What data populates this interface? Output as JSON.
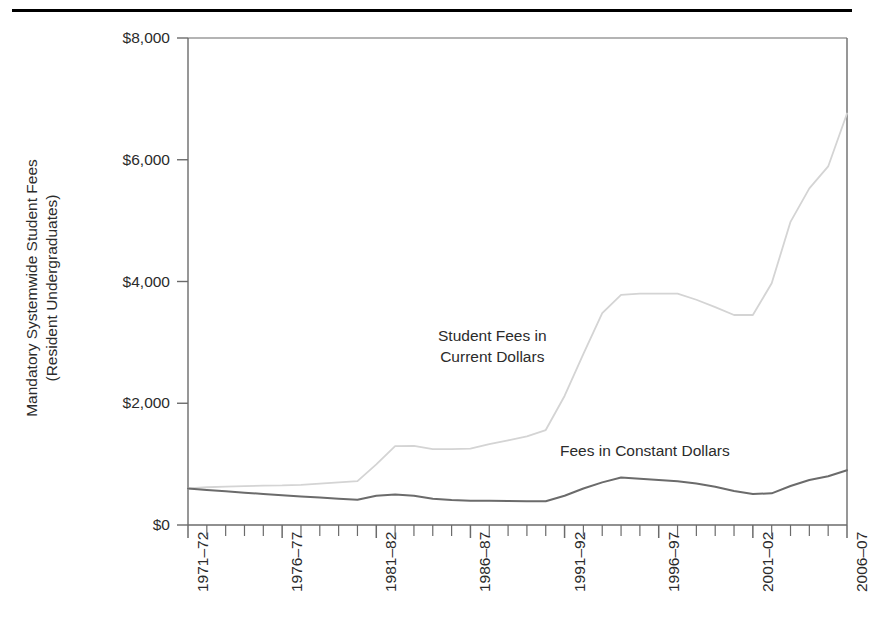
{
  "figure": {
    "background_color": "#ffffff",
    "top_rule_color": "#000000",
    "axis_color": "#6b6b6b",
    "text_color": "#2b2b2b"
  },
  "axes": {
    "y_axis_title": "Mandatory Systemwide Student Fees\n(Resident Undergraduates)",
    "y_ticks": [
      "$0",
      "$2,000",
      "$4,000",
      "$6,000",
      "$8,000"
    ],
    "x_ticks_labeled": [
      "1971–72",
      "1976–77",
      "1981–82",
      "1986–87",
      "1991–92",
      "1996–97",
      "2001–02",
      "2006–07"
    ]
  },
  "series_labels": {
    "current": "Student Fees in\nCurrent Dollars",
    "constant": "Fees in Constant Dollars"
  },
  "chart_data": {
    "type": "line",
    "title": "",
    "xlabel": "",
    "ylabel": "Mandatory Systemwide Student Fees (Resident Undergraduates)",
    "xlim": [
      "1971-72",
      "2006-07"
    ],
    "ylim": [
      0,
      8000
    ],
    "ytick_values": [
      0,
      2000,
      4000,
      6000,
      8000
    ],
    "grid": false,
    "legend": "inline-annotations",
    "x": [
      "1971-72",
      "1972-73",
      "1973-74",
      "1974-75",
      "1975-76",
      "1976-77",
      "1977-78",
      "1978-79",
      "1979-80",
      "1980-81",
      "1981-82",
      "1982-83",
      "1983-84",
      "1984-85",
      "1985-86",
      "1986-87",
      "1987-88",
      "1988-89",
      "1989-90",
      "1990-91",
      "1991-92",
      "1992-93",
      "1993-94",
      "1994-95",
      "1995-96",
      "1996-97",
      "1997-98",
      "1998-99",
      "1999-00",
      "2000-01",
      "2001-02",
      "2002-03",
      "2003-04",
      "2004-05",
      "2005-06",
      "2006-07"
    ],
    "series": [
      {
        "name": "Student Fees in Current Dollars",
        "color": "#d4d4d4",
        "values": [
          600,
          620,
          630,
          640,
          647,
          650,
          660,
          680,
          700,
          720,
          997,
          1295,
          1300,
          1245,
          1245,
          1255,
          1330,
          1390,
          1455,
          1560,
          2120,
          2810,
          3480,
          3780,
          3800,
          3800,
          3800,
          3700,
          3580,
          3450,
          3450,
          3970,
          4980,
          5530,
          5890,
          6760
        ]
      },
      {
        "name": "Fees in Constant Dollars",
        "color": "#6b6b6b",
        "values": [
          600,
          575,
          555,
          530,
          510,
          490,
          470,
          450,
          430,
          415,
          480,
          500,
          480,
          430,
          410,
          400,
          400,
          395,
          390,
          390,
          480,
          600,
          700,
          780,
          760,
          740,
          720,
          680,
          630,
          560,
          510,
          520,
          640,
          740,
          800,
          900
        ]
      }
    ]
  }
}
